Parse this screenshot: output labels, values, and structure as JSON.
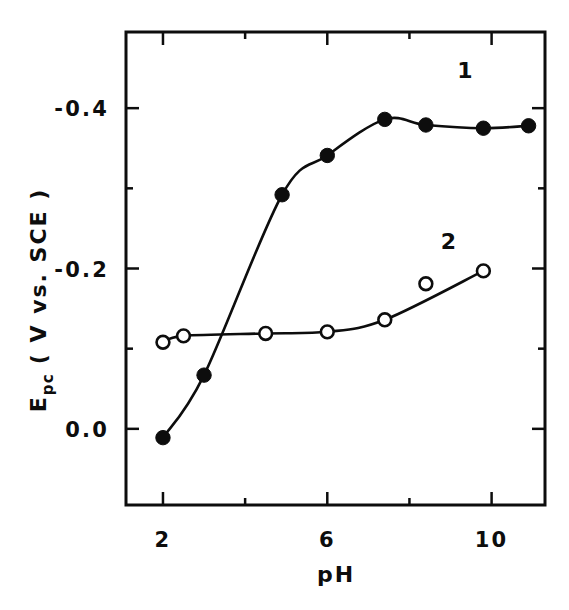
{
  "chart_data": {
    "type": "scatter",
    "title": "",
    "xlabel": "pH",
    "ylabel": "E_pc (V vs. SCE)",
    "ylabel_base": "E",
    "ylabel_subscript": "pc",
    "ylabel_units": "( V vs. SCE )",
    "xlim": [
      1.1,
      11.3
    ],
    "ylim": [
      0.095,
      -0.495
    ],
    "xticks": [
      2,
      6,
      10
    ],
    "xtick_labels": [
      "2",
      "6",
      "10"
    ],
    "x_minor_ticks": [
      4,
      8
    ],
    "yticks": [
      -0.4,
      -0.2,
      0.0
    ],
    "ytick_labels": [
      "-0.4",
      "-0.2",
      "0.0"
    ],
    "y_minor_ticks": [
      -0.3,
      -0.1
    ],
    "grid": false,
    "legend_position": "inline-curve-labels",
    "series": [
      {
        "name": "1",
        "label": "1",
        "marker": "filled-circle",
        "color": "#0d0d0d",
        "label_x": 9.35,
        "label_y": -0.437,
        "x": [
          2.0,
          3.0,
          4.9,
          6.0,
          7.4,
          8.4,
          9.8,
          10.9
        ],
        "y": [
          0.011,
          -0.067,
          -0.292,
          -0.341,
          -0.386,
          -0.379,
          -0.375,
          -0.378
        ]
      },
      {
        "name": "2",
        "label": "2",
        "marker": "open-circle",
        "color": "#0d0d0d",
        "label_x": 8.95,
        "label_y": -0.224,
        "x": [
          2.0,
          2.5,
          4.5,
          6.0,
          7.4,
          8.4,
          9.8
        ],
        "y": [
          -0.108,
          -0.116,
          -0.119,
          -0.121,
          -0.136,
          -0.181,
          -0.197
        ]
      }
    ],
    "annotations": []
  },
  "axes": {
    "x_axis_label": "pH",
    "y_axis_label": "E_pc (V vs. SCE)"
  }
}
